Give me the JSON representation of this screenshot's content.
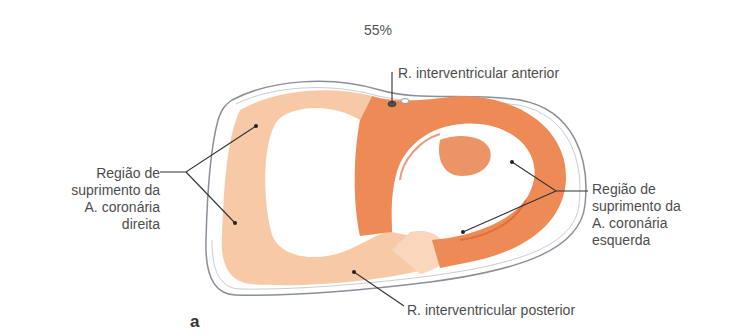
{
  "zoom_indicator": "55%",
  "figure": {
    "panel_letter": "a",
    "labels": {
      "anterior_branch": "R. interventricular anterior",
      "posterior_branch": "R. interventricular posterior",
      "right_region": [
        "Região de",
        "suprimento da",
        "A. coronária",
        "direita"
      ],
      "left_region": [
        "Região de",
        "suprimento da",
        "A. coronária",
        "esquerda"
      ]
    },
    "colors": {
      "right_supply_region": "#f7c9a6",
      "left_supply_region": "#ee8a55",
      "left_supply_dark": "#e0693a",
      "pericardium_outline": "#8a8f99",
      "leader_line": "#333333"
    }
  }
}
